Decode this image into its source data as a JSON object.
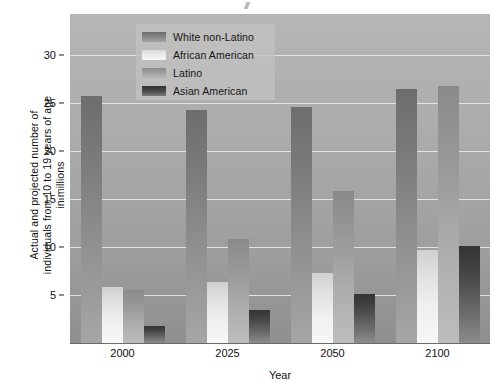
{
  "chart_data": {
    "type": "bar",
    "title": "",
    "subtitle": "",
    "xlabel": "Year",
    "ylabel": "Actual and projected number of\nindividuals from 10 to 19 years of age\nin millions",
    "categories": [
      "2000",
      "2025",
      "2050",
      "2100"
    ],
    "series": [
      {
        "name": "White non-Latino",
        "values": [
          25.8,
          24.3,
          24.6,
          26.5
        ],
        "color": "#7a7a7a"
      },
      {
        "name": "African American",
        "values": [
          5.8,
          6.4,
          7.3,
          9.7
        ],
        "color": "#e4e4e4"
      },
      {
        "name": "Latino",
        "values": [
          5.5,
          10.8,
          15.8,
          26.8
        ],
        "color": "#9c9c9c"
      },
      {
        "name": "Asian American",
        "values": [
          1.8,
          3.4,
          5.1,
          10.1
        ],
        "color": "#3d3d3d"
      }
    ],
    "ylim": [
      0,
      34.3
    ],
    "yticks": [
      5,
      10,
      15,
      20,
      25,
      30
    ],
    "ytick_labels": [
      "5",
      "10",
      "15",
      "20",
      "25",
      "30"
    ],
    "grid": true,
    "grid_axis": "y",
    "legend_position": "upper-left-inside",
    "bar_gradient": true,
    "plot_background": "#a8a8a8",
    "gridline_color": "#e8e8e8"
  },
  "legend": {
    "entries": [
      {
        "label": "White non-Latino"
      },
      {
        "label": "African American"
      },
      {
        "label": "Latino"
      },
      {
        "label": "Asian American"
      }
    ]
  },
  "axes": {
    "x": {
      "title": "Year",
      "ticks": [
        "2000",
        "2025",
        "2050",
        "2100"
      ]
    },
    "y": {
      "title": "Actual and projected number of\nindividuals from 10 to 19 years of age\nin millions",
      "ticks": [
        "5",
        "10",
        "15",
        "20",
        "25",
        "30"
      ]
    }
  }
}
